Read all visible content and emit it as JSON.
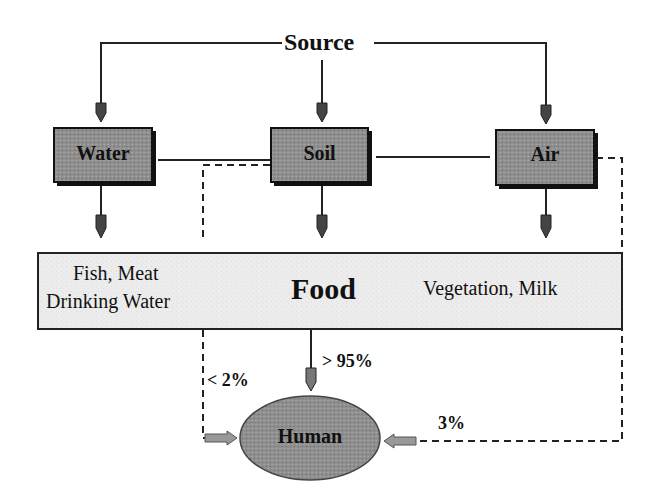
{
  "diagram": {
    "source": {
      "label": "Source"
    },
    "compartments": [
      {
        "id": "water",
        "label": "Water"
      },
      {
        "id": "soil",
        "label": "Soil"
      },
      {
        "id": "air",
        "label": "Air"
      }
    ],
    "food": {
      "label": "Food",
      "left_line1": "Fish, Meat",
      "left_line2": "Drinking Water",
      "right": "Vegetation, Milk"
    },
    "human": {
      "label": "Human"
    },
    "pathways": {
      "food_to_human": "> 95%",
      "soil_to_human": "< 2%",
      "air_to_human": "3%"
    },
    "colors": {
      "box_fill": "#8c8c8c",
      "food_fill": "#ececec",
      "ellipse_fill": "#8a8a8a",
      "line": "#222222"
    }
  }
}
